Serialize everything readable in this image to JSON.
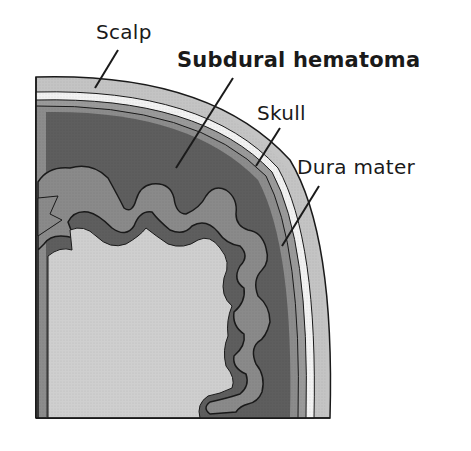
{
  "diagram": {
    "title": "Subdural hematoma",
    "labels": {
      "scalp": "Scalp",
      "subdural_hematoma": "Subdural hematoma",
      "skull": "Skull",
      "dura_mater": "Dura mater"
    },
    "colors": {
      "background": "#ffffff",
      "scalp": "#c4c4c4",
      "skull_gap": "#f2f2f2",
      "skull": "#b8b8b8",
      "dura": "#8c8c8c",
      "hematoma": "#5e5e5e",
      "brain_cortex": "#8a8a8a",
      "brain_inner": "#cfcfcf",
      "outline": "#1a1a1a"
    }
  }
}
